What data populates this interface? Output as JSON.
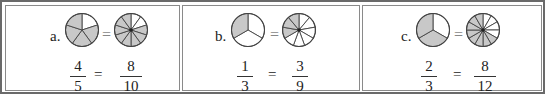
{
  "problems": [
    {
      "label": "a.",
      "equals": "=",
      "left_pie": {
        "parts": 5,
        "shaded": 4
      },
      "right_pie": {
        "parts": 10,
        "shaded": 8
      },
      "left_fraction": {
        "numerator": "4",
        "denominator": "5"
      },
      "right_fraction": {
        "numerator": "8",
        "denominator": "10"
      }
    },
    {
      "label": "b.",
      "equals": "=",
      "left_pie": {
        "parts": 3,
        "shaded": 1
      },
      "right_pie": {
        "parts": 9,
        "shaded": 3
      },
      "left_fraction": {
        "numerator": "1",
        "denominator": "3"
      },
      "right_fraction": {
        "numerator": "3",
        "denominator": "9"
      }
    },
    {
      "label": "c.",
      "equals": "=",
      "left_pie": {
        "parts": 3,
        "shaded": 2
      },
      "right_pie": {
        "parts": 12,
        "shaded": 8
      },
      "left_fraction": {
        "numerator": "2",
        "denominator": "3"
      },
      "right_fraction": {
        "numerator": "8",
        "denominator": "12"
      }
    }
  ],
  "colors": {
    "shade": "#c8c8c8",
    "line": "#444444",
    "border": "#6a6a6a"
  }
}
